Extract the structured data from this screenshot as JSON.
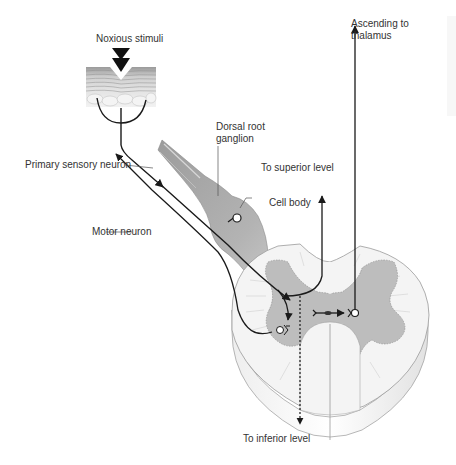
{
  "diagram": {
    "type": "anatomical-pain-pathway",
    "labels": {
      "noxious_stimuli": "Noxious stimuli",
      "ascending_line1": "Ascending to",
      "ascending_line2": "thalamus",
      "dorsal_line1": "Dorsal root",
      "dorsal_line2": "ganglion",
      "primary_sensory": "Primary sensory neuron",
      "to_superior": "To superior level",
      "cell_body": "Cell body",
      "motor_neuron": "Motor neuron",
      "to_inferior": "To inferior level"
    },
    "colors": {
      "background": "#ffffff",
      "text": "#333333",
      "line": "#1a1a1a",
      "grey_matter": "#bdbdbd",
      "white_matter": "#f2f2f2",
      "ganglion": "#a9a9a9",
      "outline": "#8a8a8a"
    },
    "nodes": [
      {
        "id": "skin",
        "label_ref": "noxious_stimuli"
      },
      {
        "id": "dorsal-root-ganglion",
        "label_ref": "dorsal_line1"
      },
      {
        "id": "cell-body",
        "label_ref": "cell_body"
      },
      {
        "id": "spinal-cord-cross-section"
      },
      {
        "id": "interneuron-synapse"
      },
      {
        "id": "motor-neuron-body"
      }
    ],
    "edges": [
      {
        "from": "skin",
        "to": "dorsal-root-ganglion",
        "style": "solid-arrow"
      },
      {
        "from": "dorsal-root-ganglion",
        "to": "interneuron-synapse",
        "style": "solid-arrow"
      },
      {
        "from": "interneuron-synapse",
        "to": "thalamus",
        "style": "solid-arrow",
        "label_ref": "ascending_line1"
      },
      {
        "from": "spinal-cord-cross-section",
        "to": "superior-level",
        "style": "solid-arrow",
        "label_ref": "to_superior"
      },
      {
        "from": "spinal-cord-cross-section",
        "to": "inferior-level",
        "style": "dotted-arrow",
        "label_ref": "to_inferior"
      },
      {
        "from": "motor-neuron-body",
        "to": "muscle",
        "style": "solid-arrow",
        "label_ref": "motor_neuron"
      }
    ]
  }
}
